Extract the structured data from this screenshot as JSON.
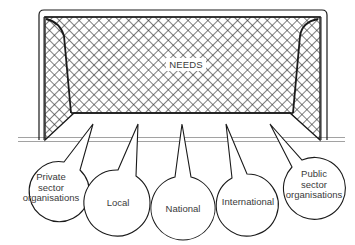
{
  "diagram": {
    "type": "goal-with-speech-balloons",
    "goal": {
      "label": "NEEDS"
    },
    "balloons": [
      {
        "id": "private-sector",
        "label": "Private\nsector\norganisations"
      },
      {
        "id": "local",
        "label": "Local"
      },
      {
        "id": "national",
        "label": "National"
      },
      {
        "id": "international",
        "label": "International"
      },
      {
        "id": "public-sector",
        "label": "Public\nsector\norganisations"
      }
    ],
    "colors": {
      "line": "#1a1a1a",
      "net": "#2a2a2a",
      "ground": "#8a8a8a",
      "text": "#3a3a3a",
      "background": "#ffffff"
    }
  }
}
